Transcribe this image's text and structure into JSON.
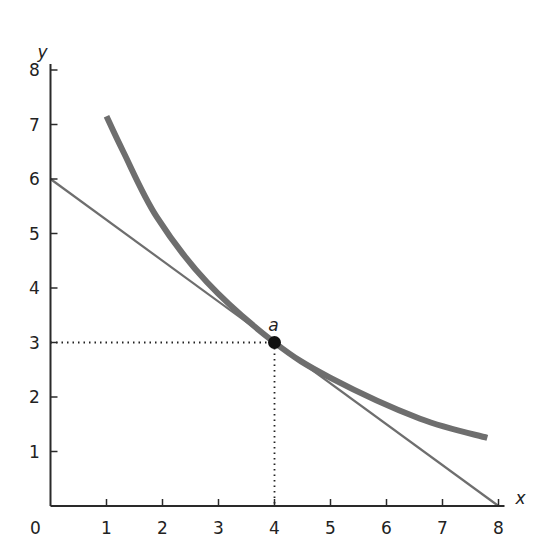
{
  "chart_data": {
    "type": "line",
    "title": "",
    "xlabel": "x",
    "ylabel": "y",
    "xlim": [
      0,
      8
    ],
    "ylim": [
      0,
      8
    ],
    "grid": false,
    "x_ticks": [
      "0",
      "1",
      "2",
      "3",
      "4",
      "5",
      "6",
      "7",
      "8"
    ],
    "y_ticks": [
      "1",
      "2",
      "3",
      "4",
      "5",
      "6",
      "7",
      "8"
    ],
    "series": [
      {
        "name": "indifference-curve",
        "style": "thick-gray",
        "color": "#6e6e6e",
        "points": [
          [
            1.0,
            7.15
          ],
          [
            1.3,
            6.5
          ],
          [
            1.9,
            5.3
          ],
          [
            2.8,
            4.1
          ],
          [
            4.0,
            3.0
          ],
          [
            5.0,
            2.35
          ],
          [
            6.6,
            1.6
          ],
          [
            7.8,
            1.25
          ]
        ]
      },
      {
        "name": "budget-line",
        "style": "thin-gray",
        "color": "#6e6e6e",
        "points": [
          [
            0,
            6
          ],
          [
            8,
            0
          ]
        ]
      }
    ],
    "annotations": [
      {
        "label": "a",
        "x": 4,
        "y": 3,
        "marker": "filled-circle",
        "dotted_guides": true
      }
    ]
  }
}
